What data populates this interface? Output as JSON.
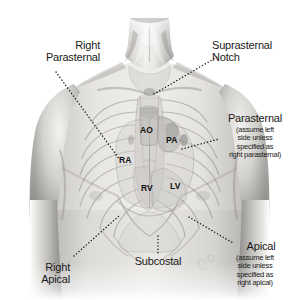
{
  "figure": {
    "background_color": "#ffffff",
    "text_color": "#1a1a1a",
    "width": 299,
    "height": 300
  },
  "labels": {
    "right_parasternal": {
      "main": "Right\nParasternal",
      "align": "right"
    },
    "suprasternal_notch": {
      "main": "Suprasternal\nNotch",
      "align": "left"
    },
    "parasternal": {
      "main": "Parasternal",
      "sub": "(assume left\nside unless\nspecified as\nright parasternal)",
      "align": "center"
    },
    "apical": {
      "main": "Apical",
      "sub": "(assume left\nside unless\nspecified as\nright apical)",
      "align": "center"
    },
    "right_apical": {
      "main": "Right\nApical",
      "align": "right"
    },
    "subcostal": {
      "main": "Subcostal",
      "align": "center"
    }
  },
  "chambers": [
    {
      "id": "ao",
      "label": "AO",
      "name": "aorta"
    },
    {
      "id": "pa",
      "label": "PA",
      "name": "pulmonary-artery"
    },
    {
      "id": "ra",
      "label": "RA",
      "name": "right-atrium"
    },
    {
      "id": "rv",
      "label": "RV",
      "name": "right-ventricle"
    },
    {
      "id": "lv",
      "label": "LV",
      "name": "left-ventricle"
    }
  ],
  "colors": {
    "skin_light": "#f2f1ef",
    "skin_mid": "#c9c7c4",
    "skin_shadow": "#8e8c89",
    "skin_deep": "#6d6b68",
    "bone": "#d8d6d3",
    "outline": "#9a9895",
    "leader": "#111111"
  }
}
